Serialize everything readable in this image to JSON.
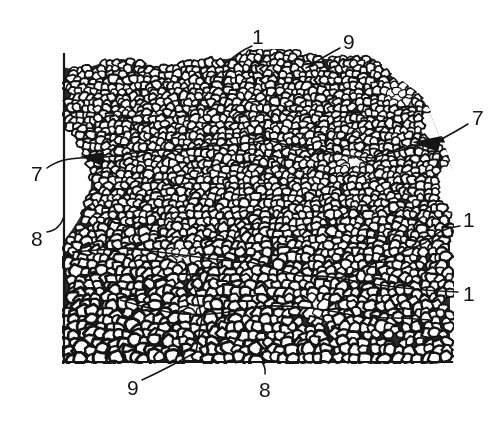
{
  "figure": {
    "kind": "patent-drawing",
    "background_color": "#ffffff",
    "ink_color": "#151515",
    "width": 498,
    "height": 423
  },
  "specimen": {
    "border": {
      "left_x": 64,
      "right_x": 452,
      "top_y": 55,
      "bottom_y": 362,
      "stroke_color": "#151515",
      "stroke_width": 2.2
    },
    "texture": {
      "name": "packed-grain-texture",
      "grain_fill": "#ffffff",
      "grain_outline": "#151515",
      "fine_grain_diameter_px": 9,
      "coarse_grain_diameter_px": 13
    },
    "voids": [
      {
        "name": "void-upper-right",
        "cx": 398,
        "cy": 96
      },
      {
        "name": "void-center-right",
        "cx": 352,
        "cy": 162
      },
      {
        "name": "void-center-left",
        "cx": 182,
        "cy": 258
      },
      {
        "name": "void-lower-center",
        "cx": 196,
        "cy": 312
      },
      {
        "name": "void-lower-right",
        "cx": 318,
        "cy": 308
      }
    ]
  },
  "reference_labels": [
    {
      "name": "ref-1-top",
      "text": "1",
      "x": 252,
      "y": 26,
      "leader": {
        "type": "curve",
        "from": [
          252,
          46
        ],
        "ctrl": [
          238,
          52
        ],
        "to": [
          228,
          62
        ]
      }
    },
    {
      "name": "ref-9-top",
      "text": "9",
      "x": 343,
      "y": 31,
      "leader": {
        "type": "line",
        "from": [
          340,
          48
        ],
        "ctrl": [
          325,
          56
        ],
        "to": [
          306,
          68
        ]
      }
    },
    {
      "name": "ref-7-right",
      "text": "7",
      "x": 472,
      "y": 107,
      "leader": {
        "type": "line",
        "from": [
          468,
          124
        ],
        "ctrl": [
          455,
          132
        ],
        "to": [
          436,
          142
        ]
      }
    },
    {
      "name": "ref-7-left",
      "text": "7",
      "x": 31,
      "y": 163,
      "leader": {
        "type": "curve",
        "from": [
          47,
          168
        ],
        "ctrl": [
          62,
          156
        ],
        "to": [
          96,
          158
        ]
      }
    },
    {
      "name": "ref-8-left",
      "text": "8",
      "x": 31,
      "y": 228,
      "leader": {
        "type": "curve",
        "from": [
          47,
          232
        ],
        "ctrl": [
          60,
          230
        ],
        "to": [
          64,
          216
        ]
      }
    },
    {
      "name": "ref-1-right-upper",
      "text": "1",
      "x": 463,
      "y": 209,
      "leader": {
        "type": "curve",
        "from": [
          460,
          226
        ],
        "ctrl": [
          440,
          228
        ],
        "to": [
          425,
          243
        ]
      }
    },
    {
      "name": "ref-1-right-lower",
      "text": "1",
      "x": 463,
      "y": 283,
      "leader": {
        "type": "line",
        "from": [
          458,
          292
        ],
        "ctrl": [
          400,
          290
        ],
        "to": [
          337,
          278
        ]
      }
    },
    {
      "name": "ref-9-bottom",
      "text": "9",
      "x": 127,
      "y": 377,
      "leader": {
        "type": "line",
        "from": [
          142,
          380
        ],
        "ctrl": [
          168,
          368
        ],
        "to": [
          196,
          352
        ]
      }
    },
    {
      "name": "ref-8-bottom",
      "text": "8",
      "x": 259,
      "y": 379,
      "leader": {
        "type": "curve",
        "from": [
          265,
          374
        ],
        "ctrl": [
          266,
          368
        ],
        "to": [
          262,
          362
        ]
      }
    }
  ]
}
